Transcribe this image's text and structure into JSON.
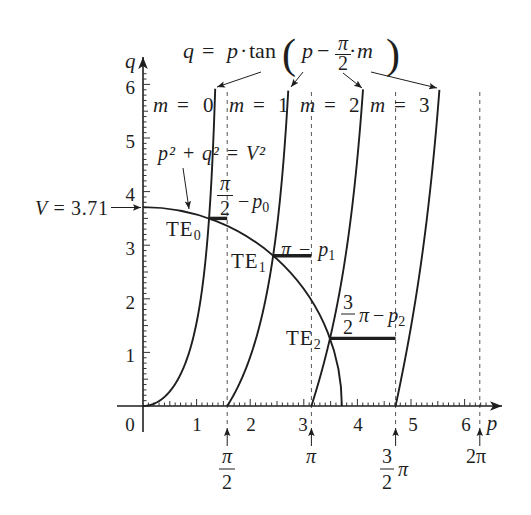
{
  "formula": {
    "q": "q",
    "eq": "=",
    "p": "p",
    "dot": "·",
    "tan": "tan",
    "lparen": "(",
    "p_inner": "p",
    "minus": "−",
    "frac_num": "π",
    "frac_den": "2",
    "dot2": "·",
    "m": "m",
    "rparen": ")"
  },
  "curve_labels": [
    {
      "var": "m",
      "eq": "=",
      "value": "0"
    },
    {
      "var": "m",
      "eq": "=",
      "value": "1"
    },
    {
      "var": "m",
      "eq": "=",
      "value": "2"
    },
    {
      "var": "m",
      "eq": "=",
      "value": "3"
    }
  ],
  "circle_label": "p² + q² = V²",
  "v_label": {
    "var": "V",
    "rest": " = 3.71"
  },
  "te_labels": [
    {
      "base": "TE",
      "sub": "0"
    },
    {
      "base": "TE",
      "sub": "1"
    },
    {
      "base": "TE",
      "sub": "2"
    }
  ],
  "offsets": [
    {
      "num": "π",
      "den": "2",
      "minus": "−",
      "var": "p",
      "sub": "0"
    },
    {
      "lead": "π",
      "minus": "−",
      "var": "p",
      "sub": "1"
    },
    {
      "num": "3",
      "den": "2",
      "lead": "π",
      "minus": "−",
      "var": "p",
      "sub": "2"
    }
  ],
  "axes": {
    "x_label": "p",
    "y_label": "q",
    "x_ticks": [
      "0",
      "1",
      "2",
      "3",
      "4",
      "5",
      "6"
    ],
    "y_ticks": [
      "1",
      "2",
      "3",
      "4",
      "5",
      "6"
    ],
    "markers": [
      {
        "num": "π",
        "den": "2"
      },
      {
        "text": "π"
      },
      {
        "num": "3",
        "den": "2",
        "suffix": "π"
      },
      {
        "text": "2π"
      }
    ]
  },
  "chart_data": {
    "type": "line",
    "xlabel": "p",
    "ylabel": "q",
    "xlim": [
      0,
      6.5
    ],
    "ylim": [
      0,
      6.3
    ],
    "grid": false,
    "legend": "none (curves labelled inline: m = 0, m = 1, m = 2, m = 3)",
    "x_ticks": [
      0,
      1,
      2,
      3,
      4,
      5,
      6
    ],
    "y_ticks": [
      1,
      2,
      3,
      4,
      5,
      6
    ],
    "series": [
      {
        "name": "m = 0",
        "m": 0,
        "p_range": [
          0,
          1.347
        ],
        "points": [
          [
            0,
            0
          ],
          [
            0.5,
            0.27
          ],
          [
            1.0,
            1.56
          ],
          [
            1.2,
            3.09
          ],
          [
            1.3,
            4.68
          ],
          [
            1.347,
            5.9
          ]
        ]
      },
      {
        "name": "m = 1",
        "m": 1,
        "p_range": [
          1.5708,
          2.71
        ],
        "points": [
          [
            1.571,
            0
          ],
          [
            2.0,
            0.92
          ],
          [
            2.2,
            1.6
          ],
          [
            2.4,
            2.62
          ],
          [
            2.6,
            4.32
          ],
          [
            2.71,
            5.9
          ]
        ]
      },
      {
        "name": "m = 2",
        "m": 2,
        "p_range": [
          3.1416,
          4.105
        ],
        "points": [
          [
            3.142,
            0
          ],
          [
            3.4,
            0.9
          ],
          [
            3.6,
            1.78
          ],
          [
            3.8,
            2.94
          ],
          [
            4.0,
            4.63
          ],
          [
            4.105,
            5.9
          ]
        ]
      },
      {
        "name": "m = 3",
        "m": 3,
        "p_range": [
          4.7124,
          5.53
        ],
        "points": [
          [
            4.712,
            0
          ],
          [
            5.0,
            1.48
          ],
          [
            5.2,
            2.76
          ],
          [
            5.4,
            4.43
          ],
          [
            5.53,
            5.9
          ]
        ]
      }
    ],
    "circle": {
      "label": "p² + q² = V²",
      "V": 3.71,
      "quadrant": "first"
    },
    "intersections": [
      {
        "label": "TE0",
        "p": 1.233,
        "q": 3.5,
        "offset_label": "π/2 − p0",
        "offset_to": 1.5708
      },
      {
        "label": "TE1",
        "p": 2.429,
        "q": 2.805,
        "offset_label": "π − p1",
        "offset_to": 3.1416
      },
      {
        "label": "TE2",
        "p": 3.489,
        "q": 1.262,
        "offset_label": "3/2 π − p2",
        "offset_to": 4.7124
      }
    ],
    "vertical_lines": [
      {
        "label": "π/2",
        "p": 1.5708,
        "style": "dashed"
      },
      {
        "label": "π",
        "p": 3.1416,
        "style": "dashed"
      },
      {
        "label": "3π/2",
        "p": 4.7124,
        "style": "dashed"
      },
      {
        "label": "2π",
        "p": 6.2832,
        "style": "dashed"
      }
    ],
    "annotations": [
      "V = 3.71 (arrow to q-axis)",
      "p² + q² = V² (arrow to circle)"
    ]
  }
}
